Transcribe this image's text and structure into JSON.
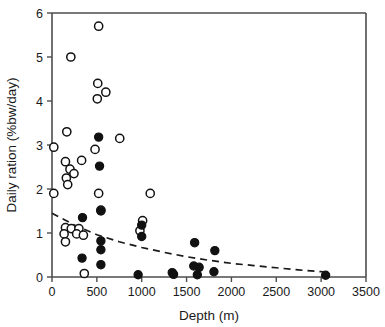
{
  "chart_data": {
    "type": "scatter",
    "title": "",
    "xlabel": "Depth (m)",
    "ylabel": "Daily ration (%bw/day)",
    "xlim": [
      0,
      3500
    ],
    "ylim": [
      0,
      6
    ],
    "xticks": [
      0,
      500,
      1000,
      1500,
      2000,
      2500,
      3000,
      3500
    ],
    "yticks": [
      0,
      1,
      2,
      3,
      4,
      5,
      6
    ],
    "xtick_labels": [
      "0",
      "500",
      "1000",
      "1500",
      "2000",
      "2500",
      "3000",
      "3500"
    ],
    "ytick_labels": [
      "0",
      "1",
      "2",
      "3",
      "4",
      "5",
      "6"
    ],
    "grid": false,
    "legend": null,
    "series": [
      {
        "name": "open-circles",
        "marker": "open circle",
        "marker_fill": "#ffffff",
        "marker_edge": "#111111",
        "points": [
          [
            520,
            5.7
          ],
          [
            210,
            5.0
          ],
          [
            510,
            4.4
          ],
          [
            600,
            4.2
          ],
          [
            505,
            4.05
          ],
          [
            165,
            3.3
          ],
          [
            755,
            3.15
          ],
          [
            20,
            2.95
          ],
          [
            480,
            2.9
          ],
          [
            330,
            2.65
          ],
          [
            150,
            2.62
          ],
          [
            200,
            2.45
          ],
          [
            245,
            2.35
          ],
          [
            160,
            2.25
          ],
          [
            175,
            2.1
          ],
          [
            20,
            1.9
          ],
          [
            520,
            1.9
          ],
          [
            1095,
            1.9
          ],
          [
            545,
            1.52
          ],
          [
            1010,
            1.28
          ],
          [
            150,
            1.12
          ],
          [
            215,
            1.1
          ],
          [
            300,
            1.1
          ],
          [
            980,
            1.05
          ],
          [
            135,
            0.98
          ],
          [
            275,
            0.98
          ],
          [
            350,
            0.95
          ],
          [
            150,
            0.8
          ],
          [
            360,
            0.08
          ]
        ]
      },
      {
        "name": "closed-circles",
        "marker": "filled circle",
        "marker_fill": "#111111",
        "marker_edge": "#111111",
        "points": [
          [
            520,
            3.18
          ],
          [
            530,
            2.52
          ],
          [
            545,
            1.5
          ],
          [
            340,
            1.35
          ],
          [
            1000,
            1.18
          ],
          [
            1000,
            0.92
          ],
          [
            545,
            0.82
          ],
          [
            1590,
            0.78
          ],
          [
            335,
            0.43
          ],
          [
            545,
            0.62
          ],
          [
            1815,
            0.6
          ],
          [
            545,
            0.28
          ],
          [
            1580,
            0.25
          ],
          [
            1640,
            0.22
          ],
          [
            960,
            0.05
          ],
          [
            1340,
            0.1
          ],
          [
            1355,
            0.06
          ],
          [
            1620,
            0.05
          ],
          [
            1805,
            0.12
          ],
          [
            3050,
            0.04
          ]
        ]
      }
    ],
    "trendline": {
      "style": "dashed",
      "color": "#1a1a1a",
      "description": "decaying exponential fit",
      "points": [
        [
          0,
          1.45
        ],
        [
          250,
          1.18
        ],
        [
          500,
          0.96
        ],
        [
          750,
          0.8
        ],
        [
          1000,
          0.67
        ],
        [
          1250,
          0.56
        ],
        [
          1500,
          0.46
        ],
        [
          1750,
          0.38
        ],
        [
          2000,
          0.31
        ],
        [
          2250,
          0.26
        ],
        [
          2500,
          0.21
        ],
        [
          2750,
          0.16
        ],
        [
          3000,
          0.12
        ],
        [
          3100,
          0.1
        ]
      ]
    }
  }
}
